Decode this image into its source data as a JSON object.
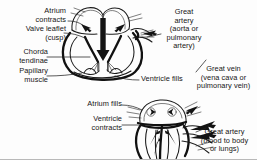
{
  "figure": {
    "ink_color": "#1b1b1b",
    "background_color": "#fdfdfd"
  },
  "panels": [
    {
      "id": "upper",
      "phase_caption": "Ventricle fills",
      "description": "Atrium contracting, AV valve open, blood flowing down into ventricle"
    },
    {
      "id": "lower",
      "phase_caption": "Ventricle contracts",
      "description": "Ventricle contracting, AV valve shut, blood ejected into great artery"
    }
  ],
  "labels": {
    "atrium_contracts": "Atrium\ncontracts",
    "valve_leaflet": "Valve leaflet\n(cusp)",
    "chorda_tendinae": "Chorda\ntendinae",
    "papillary_muscle": "Papillary\nmuscle",
    "great_artery_top": "Great\nartery\n(aorta or\npulmonary\nartery)",
    "ventricle_fills": "Ventricle fills",
    "great_vein": "Great vein\n(vena cava or\npulmonary vein)",
    "atrium_fills": "Atrium fills",
    "ventricle_contracts": "Ventricle\ncontracts",
    "great_artery_bottom": "Great artery\n(blood to body\nor lungs)"
  },
  "icons": {
    "flow_arrow": "flow-arrow-icon",
    "leader_line": "leader-line-icon"
  }
}
